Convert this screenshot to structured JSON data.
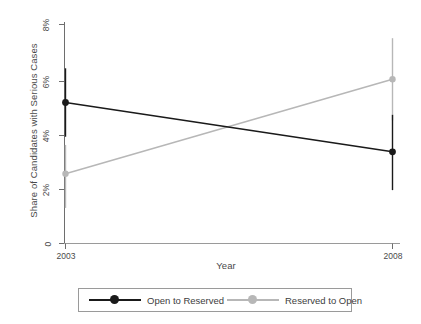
{
  "chart_data": {
    "type": "line",
    "title": "",
    "xlabel": "Year",
    "ylabel": "Share of Candidates with Serious Cases",
    "x": [
      2003,
      2008
    ],
    "xtick_labels": [
      "2003",
      "2008"
    ],
    "ytick_labels": [
      "0",
      "2%",
      "4%",
      "6%",
      "8%"
    ],
    "ytick_values": [
      0,
      2,
      4,
      6,
      8
    ],
    "ylim": [
      0,
      8.4
    ],
    "xlim": [
      2002.6,
      2008.5
    ],
    "grid": false,
    "legend_position": "below-plot",
    "units": "percent",
    "series": [
      {
        "name": "Open to Reserved",
        "color": "#1a1a1a",
        "marker": "filled-circle",
        "values": [
          5.15,
          3.35
        ],
        "ci_low": [
          3.9,
          1.95
        ],
        "ci_high": [
          6.4,
          4.7
        ]
      },
      {
        "name": "Reserved to Open",
        "color": "#b7b7b7",
        "marker": "filled-circle",
        "values": [
          2.55,
          6.0
        ],
        "ci_low": [
          1.3,
          4.5
        ],
        "ci_high": [
          3.6,
          7.5
        ]
      }
    ]
  },
  "legend": {
    "items": [
      {
        "label": "Open to Reserved",
        "color": "#1a1a1a"
      },
      {
        "label": "Reserved to Open",
        "color": "#b7b7b7"
      }
    ]
  },
  "axes": {
    "y_title": "Share of Candidates with Serious Cases",
    "x_title": "Year",
    "y_ticks": [
      "8%",
      "6%",
      "4%",
      "2%",
      "0"
    ],
    "x_ticks": [
      "2003",
      "2008"
    ]
  }
}
